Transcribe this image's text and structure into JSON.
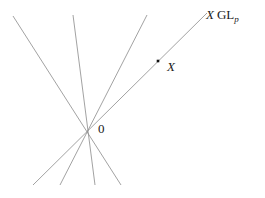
{
  "figure": {
    "width": 265,
    "height": 198,
    "background_color": "#ffffff",
    "line_color": "#8a8a8a",
    "line_width": 0.8,
    "text_color": "#1a1a1a",
    "marker_color": "#111111"
  },
  "labels": {
    "origin": "0",
    "point": "X",
    "ray_prefix": "X",
    "ray_group": "GL",
    "ray_subscript": "p",
    "ray_full": "X GLp"
  },
  "geometry": {
    "origin": {
      "x": 90,
      "y": 130
    },
    "marker": {
      "x": 158,
      "y": 61,
      "size": 2.6
    },
    "lines": [
      {
        "name": "line-1",
        "x1": 13,
        "y1": 16,
        "x2": 121,
        "y2": 185
      },
      {
        "name": "line-2",
        "x1": 73,
        "y1": 15,
        "x2": 95,
        "y2": 185
      },
      {
        "name": "line-3",
        "x1": 147,
        "y1": 15,
        "x2": 60,
        "y2": 185
      },
      {
        "name": "line-4",
        "x1": 207,
        "y1": 13,
        "x2": 33,
        "y2": 185
      }
    ]
  }
}
